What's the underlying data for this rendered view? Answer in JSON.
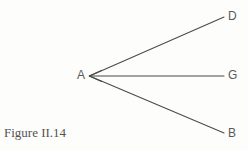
{
  "figure": {
    "caption": "Figure II.14",
    "background_color": "#fdfdfc",
    "stroke_color": "#4a4a48",
    "label_color": "#5a5a58",
    "caption_color": "#55534f"
  },
  "diagram": {
    "type": "ray-fan-angle-diagram",
    "vertex": {
      "id": "A",
      "label": "A",
      "x": 89,
      "y": 76
    },
    "endpoints": [
      {
        "id": "D",
        "label": "D",
        "x": 224,
        "y": 17
      },
      {
        "id": "G",
        "label": "G",
        "x": 224,
        "y": 76
      },
      {
        "id": "B",
        "label": "B",
        "x": 224,
        "y": 133
      }
    ],
    "rays": [
      {
        "name": "ray-AD",
        "from": "A",
        "to": "D",
        "arrowhead_at": "none"
      },
      {
        "name": "ray-AG",
        "from": "A",
        "to": "G",
        "arrowhead_at": "A"
      },
      {
        "name": "ray-AB",
        "from": "A",
        "to": "B",
        "arrowhead_at": "none"
      }
    ]
  }
}
